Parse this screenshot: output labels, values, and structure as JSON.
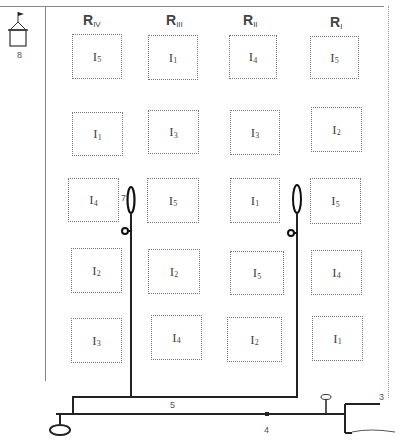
{
  "diagram": {
    "replications": [
      {
        "label": "R",
        "sub": "IV"
      },
      {
        "label": "R",
        "sub": "III"
      },
      {
        "label": "R",
        "sub": "II"
      },
      {
        "label": "R",
        "sub": "I"
      }
    ],
    "rows": [
      [
        {
          "label": "I",
          "sub": "5"
        },
        {
          "label": "I",
          "sub": "1"
        },
        {
          "label": "I",
          "sub": "4"
        },
        {
          "label": "I",
          "sub": "5"
        }
      ],
      [
        {
          "label": "I",
          "sub": "1"
        },
        {
          "label": "I",
          "sub": "3"
        },
        {
          "label": "I",
          "sub": "3"
        },
        {
          "label": "I",
          "sub": "2"
        }
      ],
      [
        {
          "label": "I",
          "sub": "4"
        },
        {
          "label": "I",
          "sub": "5"
        },
        {
          "label": "I",
          "sub": "1"
        },
        {
          "label": "I",
          "sub": "5"
        }
      ],
      [
        {
          "label": "I",
          "sub": "2"
        },
        {
          "label": "I",
          "sub": "2"
        },
        {
          "label": "I",
          "sub": "5"
        },
        {
          "label": "I",
          "sub": "4"
        }
      ],
      [
        {
          "label": "I",
          "sub": "3"
        },
        {
          "label": "I",
          "sub": "4"
        },
        {
          "label": "I",
          "sub": "2"
        },
        {
          "label": "I",
          "sub": "1"
        }
      ]
    ],
    "callouts": {
      "n3": "3",
      "n4": "4",
      "n5": "5",
      "n7": "7",
      "n8": "8"
    },
    "colors": {
      "pipe": "#222222",
      "plot_border": "#777777"
    }
  }
}
